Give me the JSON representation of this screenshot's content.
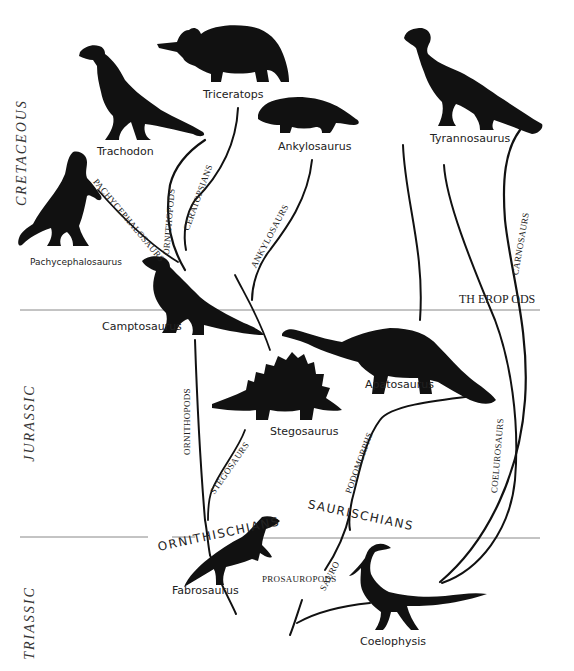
{
  "periods": [
    {
      "label": "CRETACEOUS"
    },
    {
      "label": "JURASSIC"
    },
    {
      "label": "TRIASSIC"
    }
  ],
  "major_groups": {
    "ornithischians": "ORNITHISCHIANS",
    "saurischians": "SAURISCHIANS",
    "theropods": "TH EROP ODS"
  },
  "lineages": {
    "pachycephalosaurs": "PACHYCEPHALOSAURS",
    "ornithopods_upper": "ORNITHOPODS",
    "ceratopsians": "CERATOPSIANS",
    "ankylosaurs": "ANKYLOSAURS",
    "ornithopods_lower": "ORNITHOPODS",
    "stegosaurs": "STEGOSAURS",
    "podomorphs": "PODOMORPHS",
    "sauro": "SAURO",
    "prosauropods": "PROSAUROPODS",
    "coelurosaurs": "COELUROSAURS",
    "carnosaurs": "CARNOSAURS"
  },
  "dinosaurs": [
    {
      "id": "trachodon",
      "name": "Trachodon"
    },
    {
      "id": "triceratops",
      "name": "Triceratops"
    },
    {
      "id": "ankylosaurus",
      "name": "Ankylosaurus"
    },
    {
      "id": "tyrannosaurus",
      "name": "Tyrannosaurus"
    },
    {
      "id": "pachycephalosaurus",
      "name": "Pachycephalosaurus"
    },
    {
      "id": "camptosaurus",
      "name": "Camptosaurus"
    },
    {
      "id": "apatosaurus",
      "name": "Apatosaurus"
    },
    {
      "id": "stegosaurus",
      "name": "Stegosaurus"
    },
    {
      "id": "fabrosaurus",
      "name": "Fabrosaurus"
    },
    {
      "id": "coelophysis",
      "name": "Coelophysis"
    }
  ],
  "colors": {
    "ink": "#111111",
    "rule": "#888888",
    "background": "#ffffff"
  }
}
